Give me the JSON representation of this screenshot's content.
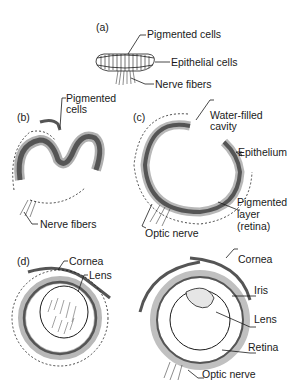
{
  "figure": {
    "panels": [
      {
        "id": "a",
        "tag": "(a)",
        "labels": [
          "Pigmented cells",
          "Epithelial cells",
          "Nerve fibers"
        ]
      },
      {
        "id": "b",
        "tag": "(b)",
        "labels": [
          "Pigmented",
          "cells",
          "Nerve fibers"
        ]
      },
      {
        "id": "c",
        "tag": "(c)",
        "labels": [
          "Water-filled",
          "cavity",
          "Epithelium",
          "Pigmented",
          "layer",
          "(retina)",
          "Optic nerve"
        ]
      },
      {
        "id": "d",
        "tag": "(d)",
        "labels": [
          "Cornea",
          "Lens"
        ]
      },
      {
        "id": "e",
        "tag": "",
        "labels": [
          "Cornea",
          "Iris",
          "Lens",
          "Retina",
          "Optic nerve"
        ]
      }
    ]
  },
  "colors": {
    "ink": "#1a1a1a",
    "shade": "#8a8a8a",
    "light": "#c8c8c8",
    "background": "#ffffff"
  }
}
